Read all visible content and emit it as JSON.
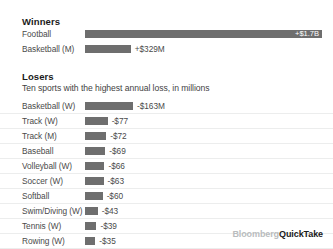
{
  "winners": {
    "title": "Winners",
    "rows": [
      {
        "label": "Football",
        "value_text": "+$1.7B",
        "value": 1700,
        "bar_pct": 100,
        "label_inside": true
      },
      {
        "label": "Basketball (M)",
        "value_text": "+$329M",
        "value": 329,
        "bar_pct": 19.3,
        "label_inside": false
      }
    ]
  },
  "losers": {
    "title": "Losers",
    "subtitle": "Ten sports with the highest annual loss, in millions",
    "rows": [
      {
        "label": "Basketball (W)",
        "value_text": "-$163M",
        "value": -163,
        "bar_pct": 100
      },
      {
        "label": "Track (W)",
        "value_text": "-$77",
        "value": -77,
        "bar_pct": 47.2
      },
      {
        "label": "Track (M)",
        "value_text": "-$72",
        "value": -72,
        "bar_pct": 44.2
      },
      {
        "label": "Baseball",
        "value_text": "-$69",
        "value": -69,
        "bar_pct": 42.3
      },
      {
        "label": "Volleyball (W)",
        "value_text": "-$66",
        "value": -66,
        "bar_pct": 40.5
      },
      {
        "label": "Soccer (W)",
        "value_text": "-$63",
        "value": -63,
        "bar_pct": 38.7
      },
      {
        "label": "Softball",
        "value_text": "-$60",
        "value": -60,
        "bar_pct": 36.8
      },
      {
        "label": "Swim/Diving (W)",
        "value_text": "-$43",
        "value": -43,
        "bar_pct": 26.4
      },
      {
        "label": "Tennis (W)",
        "value_text": "-$39",
        "value": -39,
        "bar_pct": 23.9
      },
      {
        "label": "Rowing (W)",
        "value_text": "-$35",
        "value": -35,
        "bar_pct": 21.5
      }
    ]
  },
  "footer": {
    "brand_primary": "Bloomberg",
    "brand_secondary": "QuickTake"
  },
  "colors": {
    "bar": "#6e6e6e",
    "rule": "#eceded",
    "text": "#4a4a4a",
    "heading": "#1a1a1a"
  },
  "chart_data": {
    "type": "bar",
    "xlabel": "",
    "ylabel": "",
    "grid": false,
    "legend": "none",
    "orientation": "horizontal",
    "panels": [
      {
        "name": "Winners",
        "title": "Winners",
        "subtitle": "",
        "unit": "USD",
        "categories": [
          "Football",
          "Basketball (M)"
        ],
        "values": [
          1700,
          329
        ],
        "value_labels": [
          "+$1.7B",
          "+$329M"
        ],
        "xlim": [
          0,
          1700
        ]
      },
      {
        "name": "Losers",
        "title": "Losers",
        "subtitle": "Ten sports with the highest annual loss, in millions",
        "unit": "USD millions",
        "categories": [
          "Basketball (W)",
          "Track (W)",
          "Track (M)",
          "Baseball",
          "Volleyball (W)",
          "Soccer (W)",
          "Softball",
          "Swim/Diving (W)",
          "Tennis (W)",
          "Rowing (W)"
        ],
        "values": [
          -163,
          -77,
          -72,
          -69,
          -66,
          -63,
          -60,
          -43,
          -39,
          -35
        ],
        "value_labels": [
          "-$163M",
          "-$77",
          "-$72",
          "-$69",
          "-$66",
          "-$63",
          "-$60",
          "-$43",
          "-$39",
          "-$35"
        ],
        "xlim": [
          -163,
          0
        ]
      }
    ]
  }
}
